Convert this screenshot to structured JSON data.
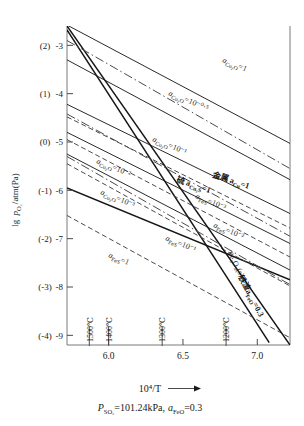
{
  "chart_data": {
    "type": "line",
    "title": "",
    "xlabel": "10^4/T",
    "ylabel": "lg p(O2)/atm(Pa)",
    "xlim": [
      5.72,
      7.22
    ],
    "ylim": [
      -9.2,
      -2.6
    ],
    "grid": false,
    "legend_position": "inline-curve-labels",
    "caption": "P_SO2=101.24kPa, a_FeO=0.3",
    "x_ticks": [
      "6.0",
      "6.5",
      "7.0"
    ],
    "x_tick_values": [
      6.0,
      6.5,
      7.0
    ],
    "y_ticks_outer": [
      "(2)",
      "(1)",
      "(0)",
      "(-1)",
      "(-2)",
      "(-3)",
      "(-4)"
    ],
    "y_ticks_inner": [
      "-3",
      "-4",
      "-5",
      "-6",
      "-7",
      "-8",
      "-9"
    ],
    "y_tick_values": [
      -3,
      -4,
      -5,
      -6,
      -7,
      -8,
      -9
    ],
    "temperature_ticks": [
      {
        "label": "1500℃",
        "x": 5.87
      },
      {
        "label": "1400℃",
        "x": 6.0
      },
      {
        "label": "1300℃",
        "x": 6.36
      },
      {
        "label": "1200℃",
        "x": 6.79
      }
    ],
    "series": [
      {
        "name": "a_Cu2O=1",
        "style": "solid",
        "label": "a",
        "sub": "Cu₂O",
        "eq": "=1",
        "points": [
          [
            5.72,
            -2.58
          ],
          [
            7.22,
            -5.03
          ]
        ]
      },
      {
        "name": "a_Cu2O=10^-0.5",
        "style": "solid",
        "label": "a",
        "sub": "Cu₂O",
        "eq": "=10⁻⁰·⁵",
        "points": [
          [
            5.72,
            -3.3
          ],
          [
            7.22,
            -5.78
          ]
        ]
      },
      {
        "name": "a_Cu2O=10^-1",
        "style": "solid",
        "label": "a",
        "sub": "Cu₂O",
        "eq": "=10⁻¹",
        "points": [
          [
            5.72,
            -4.22
          ],
          [
            7.22,
            -6.48
          ]
        ]
      },
      {
        "name": "a_Cu2O=10^-2",
        "style": "solid",
        "label": "a",
        "sub": "Cu₂O",
        "eq": "=10⁻²",
        "points": [
          [
            5.72,
            -4.8
          ],
          [
            7.22,
            -7.1
          ]
        ]
      },
      {
        "name": "a_Cu2O=10^-3",
        "style": "solid",
        "label": "a",
        "sub": "Cu₂O",
        "eq": "=10⁻³",
        "points": [
          [
            5.72,
            -5.25
          ],
          [
            7.22,
            -7.65
          ]
        ]
      },
      {
        "name": "metal a_Cu=1",
        "style": "heavy",
        "label": "金属 a",
        "sub": "Cu",
        "eq": "=1",
        "points": [
          [
            5.72,
            -5.95
          ],
          [
            7.22,
            -7.85
          ]
        ]
      },
      {
        "name": "sulfur a_Cu2S=1",
        "style": "heavy",
        "label": "硫 a",
        "sub": "Cu₂S",
        "eq": "=1",
        "points": [
          [
            5.72,
            -2.68
          ],
          [
            7.08,
            -9.15
          ]
        ]
      },
      {
        "name": "a_FeS=10^-3",
        "style": "dashed",
        "label": "a",
        "sub": "FeS",
        "eq": "=10⁻³",
        "points": [
          [
            5.72,
            -4.48
          ],
          [
            7.22,
            -6.78
          ]
        ]
      },
      {
        "name": "a_FeS=10^-2",
        "style": "dashed",
        "label": "a",
        "sub": "FeS",
        "eq": "=10⁻²",
        "points": [
          [
            5.72,
            -4.95
          ],
          [
            7.22,
            -7.38
          ]
        ]
      },
      {
        "name": "a_FeS=10^-1",
        "style": "dashed",
        "label": "a",
        "sub": "FeS",
        "eq": "=10⁻¹",
        "points": [
          [
            5.72,
            -5.45
          ],
          [
            7.22,
            -7.98
          ]
        ]
      },
      {
        "name": "a_FeS=1",
        "style": "dashed",
        "label": "a",
        "sub": "FeS",
        "eq": "=1",
        "points": [
          [
            5.72,
            -6.52
          ],
          [
            7.22,
            -9.05
          ]
        ]
      },
      {
        "name": "Fe3O4(s) slag a_FeO=0.3",
        "style": "heavy",
        "label": "Fe₃O₄(s)",
        "sub": "",
        "eq": "",
        "points": [
          [
            5.72,
            -2.6
          ],
          [
            7.22,
            -9.2
          ]
        ]
      },
      {
        "name": "dashdot-upper",
        "style": "dashdot",
        "label": "",
        "sub": "",
        "eq": "",
        "points": [
          [
            5.72,
            -2.9
          ],
          [
            7.22,
            -5.55
          ]
        ]
      },
      {
        "name": "dashdot-mid",
        "style": "dashdot",
        "label": "",
        "sub": "",
        "eq": "",
        "points": [
          [
            5.72,
            -4.42
          ],
          [
            7.22,
            -6.95
          ]
        ]
      },
      {
        "name": "dashdot-low",
        "style": "dashdot",
        "label": "",
        "sub": "",
        "eq": "",
        "points": [
          [
            5.72,
            -5.3
          ],
          [
            7.22,
            -7.95
          ]
        ]
      }
    ],
    "curve_labels": [
      {
        "text": "a",
        "sub": "Cu₂O",
        "eq": "=1",
        "x": 222,
        "y": 62,
        "rot": 22
      },
      {
        "text": "a",
        "sub": "Cu₂O",
        "eq": "=10⁻⁰·⁵",
        "x": 168,
        "y": 95,
        "rot": 22
      },
      {
        "text": "a",
        "sub": "Cu₂O",
        "eq": "=10⁻¹",
        "x": 152,
        "y": 141,
        "rot": 22
      },
      {
        "text": "a",
        "sub": "Cu₂O",
        "eq": "=10⁻²",
        "x": 96,
        "y": 163,
        "rot": 22
      },
      {
        "text": "a",
        "sub": "Cu₂O",
        "eq": "=10⁻³",
        "x": 100,
        "y": 194,
        "rot": 22
      },
      {
        "text": "金属 a",
        "sub": "Cu",
        "eq": "=1",
        "x": 212,
        "y": 177,
        "rot": 18
      },
      {
        "text": "硫 a",
        "sub": "Cu₂S",
        "eq": "=1",
        "x": 176,
        "y": 182,
        "rot": 18
      },
      {
        "text": "a",
        "sub": "FeS",
        "eq": "=10⁻³",
        "x": 195,
        "y": 198,
        "rot": 22
      },
      {
        "text": "a",
        "sub": "FeS",
        "eq": "=10⁻²",
        "x": 213,
        "y": 227,
        "rot": 22
      },
      {
        "text": "a",
        "sub": "FeS",
        "eq": "=10⁻¹",
        "x": 165,
        "y": 240,
        "rot": 22
      },
      {
        "text": "a",
        "sub": "FeS",
        "eq": "=1",
        "x": 108,
        "y": 257,
        "rot": 22
      },
      {
        "text": "Fe₃O₄(s)",
        "sub": "",
        "eq": "",
        "x": 227,
        "y": 253,
        "rot": 62
      },
      {
        "text": "铁渣a",
        "sub": "FeO",
        "eq": "=0.3",
        "x": 238,
        "y": 277,
        "rot": 62
      }
    ]
  },
  "axes": {
    "y_axis_title_parts": {
      "lg": "lg",
      "p": "p",
      "sub": "O₂",
      "unit": "/atm(Pa)"
    },
    "x_axis_title": "10⁴/T",
    "arrow": "→",
    "caption_parts": {
      "p": "P",
      "psub": "SO₂",
      "val1": "=101.24kPa,",
      "a": "a",
      "asub": "FeO",
      "val2": "=0.3"
    }
  }
}
